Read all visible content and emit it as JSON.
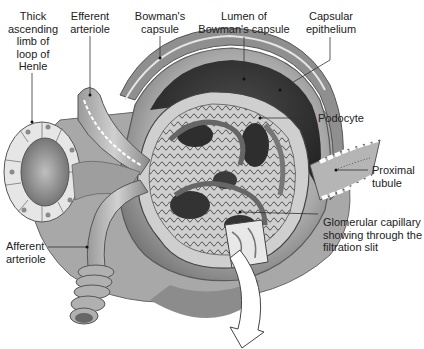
{
  "diagram": {
    "style": "grayscale anatomical illustration",
    "labels": [
      {
        "id": "thick-ascending-limb",
        "text": "Thick\nascending\nlimb of\nloop of\nHenle"
      },
      {
        "id": "efferent-arteriole",
        "text": "Efferent\narteriole"
      },
      {
        "id": "bowmans-capsule",
        "text": "Bowman's\ncapsule"
      },
      {
        "id": "lumen-bowmans-capsule",
        "text": "Lumen of\nBowman's capsule"
      },
      {
        "id": "capsular-epithelium",
        "text": "Capsular\nepithelium"
      },
      {
        "id": "podocyte",
        "text": "Podocyte"
      },
      {
        "id": "proximal-tubule",
        "text": "Proximal\ntubule"
      },
      {
        "id": "glomerular-capillary",
        "text": "Glomerular capillary\nshowing through the\nfiltration slit"
      },
      {
        "id": "afferent-arteriole",
        "text": "Afferent\narteriole"
      }
    ],
    "label_lines": {
      "thick_1": "Thick",
      "thick_2": "ascending",
      "thick_3": "limb of",
      "thick_4": "loop of",
      "thick_5": "Henle",
      "eff_1": "Efferent",
      "eff_2": "arteriole",
      "bow_1": "Bowman's",
      "bow_2": "capsule",
      "lum_1": "Lumen of",
      "lum_2": "Bowman's capsule",
      "cap_1": "Capsular",
      "cap_2": "epithelium",
      "pod_1": "Podocyte",
      "prox_1": "Proximal",
      "prox_2": "tubule",
      "glom_1": "Glomerular capillary",
      "glom_2": "showing through the",
      "glom_3": "filtration slit",
      "aff_1": "Afferent",
      "aff_2": "arteriole"
    },
    "arrow": {
      "direction": "down",
      "meaning": "magnified-view-indicator"
    }
  }
}
